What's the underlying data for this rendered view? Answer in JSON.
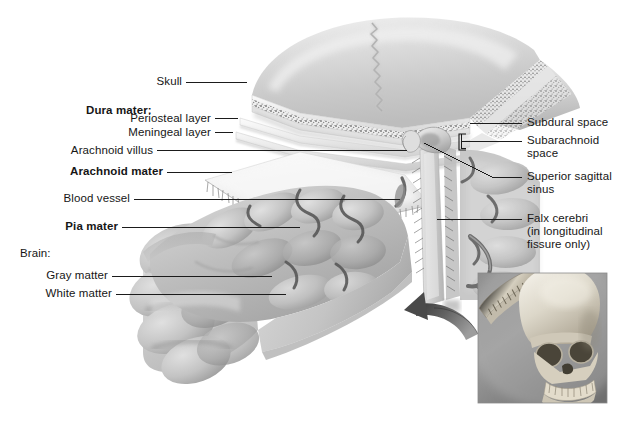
{
  "figure": {
    "background_color": "#ffffff",
    "text_color": "#161616",
    "leader_color": "#1b1b1b"
  },
  "labels_left": [
    {
      "id": "skull",
      "text": "Skull",
      "bold": false
    },
    {
      "id": "dura-mater",
      "text": "Dura mater:",
      "bold": true
    },
    {
      "id": "periosteal-layer",
      "text": "Periosteal layer",
      "bold": false
    },
    {
      "id": "meningeal-layer",
      "text": "Meningeal layer",
      "bold": false
    },
    {
      "id": "arachnoid-villus",
      "text": "Arachnoid villus",
      "bold": false
    },
    {
      "id": "arachnoid-mater",
      "text": "Arachnoid mater",
      "bold": true
    },
    {
      "id": "blood-vessel",
      "text": "Blood vessel",
      "bold": false
    },
    {
      "id": "pia-mater",
      "text": "Pia mater",
      "bold": true
    },
    {
      "id": "brain",
      "text": "Brain:",
      "bold": false
    },
    {
      "id": "gray-matter",
      "text": "Gray matter",
      "bold": false
    },
    {
      "id": "white-matter",
      "text": "White matter",
      "bold": false
    }
  ],
  "labels_right": [
    {
      "id": "subdural-space",
      "line1": "Subdural space",
      "line2": ""
    },
    {
      "id": "subarachnoid-space",
      "line1": "Subarachnoid",
      "line2": "space"
    },
    {
      "id": "superior-sagittal-sinus",
      "line1": "Superior sagittal",
      "line2": "sinus"
    },
    {
      "id": "falx-cerebri",
      "line1": "Falx cerebri",
      "line2": "(in longitudinal",
      "line3": "fissure only)"
    }
  ],
  "inset": {
    "id": "skull-inset",
    "description": "skull-with-calvaria-removed",
    "border_color": "#8a8a8a"
  }
}
